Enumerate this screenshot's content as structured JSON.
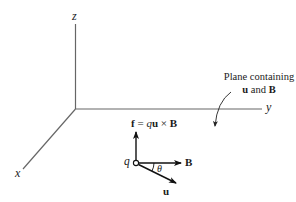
{
  "diagram": {
    "axes": {
      "x_label": "x",
      "y_label": "y",
      "z_label": "z"
    },
    "annotation": {
      "line1": "Plane containing",
      "line2_u": "u",
      "line2_and": " and ",
      "line2_B": "B"
    },
    "charge_label": "q",
    "force_label": {
      "f": "f",
      "eq": " = ",
      "q": "q",
      "u": "u",
      "times": " × ",
      "B": "B"
    },
    "vector_B_label": "B",
    "vector_u_label": "u",
    "angle_label": "θ",
    "colors": {
      "axis": "#555555",
      "vector": "#111111"
    }
  }
}
